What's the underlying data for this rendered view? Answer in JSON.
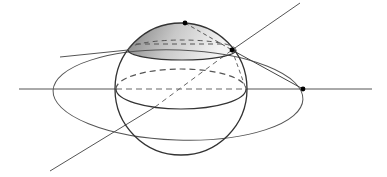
{
  "diagram": {
    "title": "",
    "colors": {
      "stroke": "#333333",
      "thin": "#555555",
      "dash": "#555555",
      "cap_dark": "#7a7a7a",
      "cap_light": "#f2f2f2",
      "point": "#000000"
    },
    "sphere": {
      "cx": 181,
      "cy": 89,
      "r": 66
    },
    "equator": {
      "cx": 181,
      "cy": 89,
      "rx": 65,
      "ry": 20
    },
    "cap_base": {
      "cx": 182,
      "cy": 50,
      "rx": 54,
      "ry": 10
    },
    "big_ellipse": {
      "cx": 178,
      "cy": 95,
      "rx": 125,
      "ry": 45,
      "rotate": 2
    },
    "horizontal_axis": {
      "x1": 19,
      "y1": 89,
      "x2": 372,
      "y2": 89
    },
    "diagonal_line": {
      "x1": 50,
      "y1": 171,
      "x2": 300,
      "y2": 3
    },
    "points": [
      {
        "name": "cap-apex",
        "x": 185,
        "y": 23
      },
      {
        "name": "cap-edge-right",
        "x": 232,
        "y": 50
      },
      {
        "name": "ellipse-right-vertex",
        "x": 303,
        "y": 89
      }
    ]
  }
}
